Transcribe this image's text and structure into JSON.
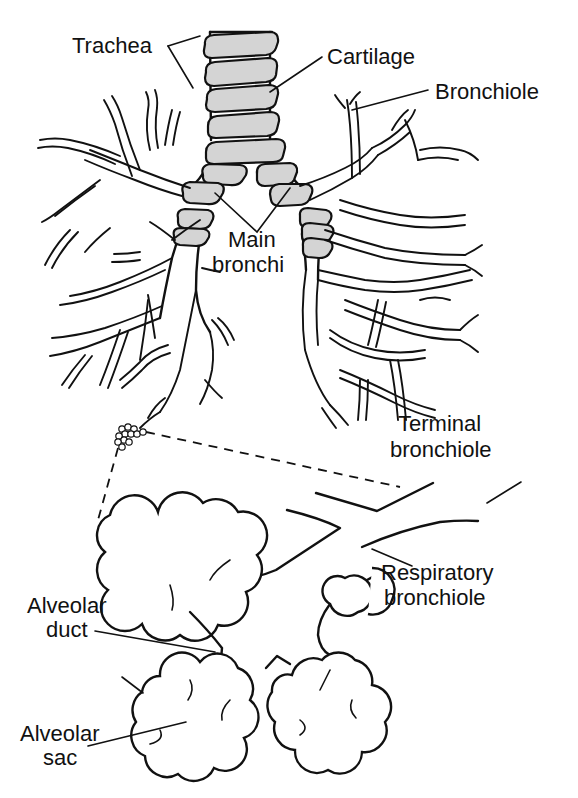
{
  "diagram": {
    "colors": {
      "ink": "#111111",
      "cartilage_fill": "#d4d4d4",
      "background": "#ffffff"
    },
    "labels": {
      "trachea": "Trachea",
      "cartilage": "Cartilage",
      "bronchiole": "Bronchiole",
      "main_bronchi_line1": "Main",
      "main_bronchi_line2": "bronchi",
      "terminal_bronchiole_line1": "Terminal",
      "terminal_bronchiole_line2": "bronchiole",
      "respiratory_bronchiole_line1": "Respiratory",
      "respiratory_bronchiole_line2": "bronchiole",
      "alveolar_duct_line1": "Alveolar",
      "alveolar_duct_line2": "duct",
      "alveolar_sac_line1": "Alveolar",
      "alveolar_sac_line2": "sac"
    },
    "structures": [
      "trachea",
      "cartilage-rings",
      "main-bronchi",
      "left-lung-bronchial-tree",
      "right-lung-bronchial-tree",
      "terminal-bronchiole",
      "respiratory-bronchiole",
      "alveolar-duct",
      "alveolar-sac",
      "magnification-callout"
    ]
  }
}
